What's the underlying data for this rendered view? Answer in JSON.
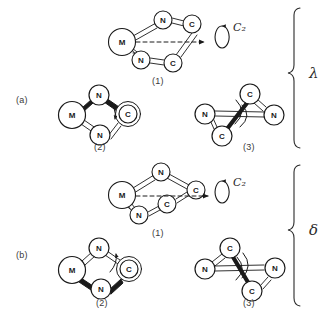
{
  "figure": {
    "type": "chemical-structure-diagram",
    "background_color": "#ffffff",
    "line_color": "#1a1a1a",
    "atom_fill_color": "#ffffff"
  },
  "panels": [
    {
      "key": "a",
      "label": "(a)",
      "chirality_label": "λ",
      "structures": [
        {
          "key": "a1",
          "label": "(1)",
          "view": "perspective-ring",
          "atoms": [
            {
              "id": "M",
              "symbol": "M",
              "x": 122,
              "y": 42,
              "r": 13,
              "size": "large"
            },
            {
              "id": "N1",
              "symbol": "N",
              "x": 163,
              "y": 20,
              "r": 9,
              "size": "small"
            },
            {
              "id": "C1",
              "symbol": "C",
              "x": 192,
              "y": 24,
              "r": 9,
              "size": "small"
            },
            {
              "id": "C2",
              "symbol": "C",
              "x": 173,
              "y": 63,
              "r": 9,
              "size": "small"
            },
            {
              "id": "N2",
              "symbol": "N",
              "x": 141,
              "y": 60,
              "r": 9,
              "size": "small"
            }
          ],
          "bonds": [
            {
              "from": "M",
              "to": "N1",
              "style": "double-line"
            },
            {
              "from": "N1",
              "to": "C1",
              "style": "double-line"
            },
            {
              "from": "C1",
              "to": "C2",
              "style": "double-line"
            },
            {
              "from": "C2",
              "to": "N2",
              "style": "double-line"
            },
            {
              "from": "N2",
              "to": "M",
              "style": "double-line"
            }
          ],
          "axis": {
            "type": "dashed-arrow",
            "x1": 132,
            "y1": 42,
            "x2": 205,
            "y2": 42,
            "label": "C₂"
          }
        },
        {
          "key": "a2",
          "label": "(2)",
          "view": "newman-like",
          "atoms": [
            {
              "id": "M",
              "symbol": "M",
              "x": 72,
              "y": 115,
              "r": 13,
              "size": "large"
            },
            {
              "id": "N1",
              "symbol": "N",
              "x": 99,
              "y": 95,
              "r": 10,
              "size": "small"
            },
            {
              "id": "C",
              "symbol": "C",
              "x": 128,
              "y": 114,
              "r": 10,
              "size": "ringed"
            },
            {
              "id": "N2",
              "symbol": "N",
              "x": 100,
              "y": 135,
              "r": 10,
              "size": "small"
            }
          ],
          "bonds": [
            {
              "from": "M",
              "to": "N1",
              "style": "bold-wedge"
            },
            {
              "from": "N1",
              "to": "C",
              "style": "bold-wedge"
            },
            {
              "from": "M",
              "to": "N2",
              "style": "double-line"
            },
            {
              "from": "N2",
              "to": "C",
              "style": "double-line"
            }
          ],
          "curved_arrow": true
        },
        {
          "key": "a3",
          "label": "(3)",
          "view": "newman-projection",
          "atoms": [
            {
              "id": "Ctop",
              "symbol": "C",
              "x": 250,
              "y": 94,
              "r": 10,
              "size": "small"
            },
            {
              "id": "Nleft",
              "symbol": "N",
              "x": 205,
              "y": 114,
              "r": 10,
              "size": "small"
            },
            {
              "id": "Nright",
              "symbol": "N",
              "x": 274,
              "y": 115,
              "r": 10,
              "size": "small"
            },
            {
              "id": "Cbot",
              "symbol": "C",
              "x": 222,
              "y": 136,
              "r": 10,
              "size": "small"
            }
          ],
          "bonds": [
            {
              "from": "Ctop",
              "to": "Cbot",
              "style": "bold-line"
            },
            {
              "from": "Nleft",
              "to": "Cbot",
              "style": "double-line"
            },
            {
              "from": "Nleft",
              "to": "Nright",
              "style": "double-line"
            },
            {
              "from": "Ctop",
              "to": "Nright",
              "style": "double-line"
            }
          ],
          "curved_arrow": true
        }
      ]
    },
    {
      "key": "b",
      "label": "(b)",
      "chirality_label": "δ",
      "structures": [
        {
          "key": "b1",
          "label": "(1)",
          "view": "perspective-ring",
          "atoms": [
            {
              "id": "M",
              "symbol": "M",
              "x": 122,
              "y": 195,
              "r": 13,
              "size": "large"
            },
            {
              "id": "N1",
              "symbol": "N",
              "x": 161,
              "y": 172,
              "r": 9,
              "size": "small"
            },
            {
              "id": "C1",
              "symbol": "C",
              "x": 196,
              "y": 190,
              "r": 9,
              "size": "small"
            },
            {
              "id": "C2",
              "symbol": "C",
              "x": 167,
              "y": 204,
              "r": 9,
              "size": "small"
            },
            {
              "id": "N2",
              "symbol": "N",
              "x": 139,
              "y": 215,
              "r": 9,
              "size": "small"
            }
          ],
          "bonds": [
            {
              "from": "M",
              "to": "N1",
              "style": "double-line"
            },
            {
              "from": "N1",
              "to": "C1",
              "style": "double-line"
            },
            {
              "from": "C1",
              "to": "C2",
              "style": "double-line"
            },
            {
              "from": "C2",
              "to": "N2",
              "style": "double-line"
            },
            {
              "from": "N2",
              "to": "M",
              "style": "double-line"
            }
          ],
          "axis": {
            "type": "dashed-arrow",
            "x1": 132,
            "y1": 196,
            "x2": 208,
            "y2": 196,
            "label": "C₂"
          }
        },
        {
          "key": "b2",
          "label": "(2)",
          "view": "newman-like",
          "atoms": [
            {
              "id": "M",
              "symbol": "M",
              "x": 72,
              "y": 270,
              "r": 13,
              "size": "large"
            },
            {
              "id": "N1",
              "symbol": "N",
              "x": 99,
              "y": 248,
              "r": 10,
              "size": "small"
            },
            {
              "id": "C",
              "symbol": "C",
              "x": 129,
              "y": 269,
              "r": 10,
              "size": "ringed"
            },
            {
              "id": "N2",
              "symbol": "N",
              "x": 101,
              "y": 289,
              "r": 10,
              "size": "small"
            }
          ],
          "bonds": [
            {
              "from": "M",
              "to": "N1",
              "style": "double-line"
            },
            {
              "from": "N1",
              "to": "C",
              "style": "double-line"
            },
            {
              "from": "M",
              "to": "N2",
              "style": "bold-wedge"
            },
            {
              "from": "N2",
              "to": "C",
              "style": "bold-wedge"
            }
          ],
          "curved_arrow": true
        },
        {
          "key": "b3",
          "label": "(3)",
          "view": "newman-projection",
          "atoms": [
            {
              "id": "Ctop",
              "symbol": "C",
              "x": 230,
              "y": 248,
              "r": 10,
              "size": "small"
            },
            {
              "id": "Nleft",
              "symbol": "N",
              "x": 205,
              "y": 269,
              "r": 10,
              "size": "small"
            },
            {
              "id": "Nright",
              "symbol": "N",
              "x": 275,
              "y": 268,
              "r": 10,
              "size": "small"
            },
            {
              "id": "Cbot",
              "symbol": "C",
              "x": 252,
              "y": 291,
              "r": 10,
              "size": "small"
            }
          ],
          "bonds": [
            {
              "from": "Ctop",
              "to": "Cbot",
              "style": "bold-line"
            },
            {
              "from": "Ctop",
              "to": "Nleft",
              "style": "double-line"
            },
            {
              "from": "Nleft",
              "to": "Nright",
              "style": "double-line"
            },
            {
              "from": "Cbot",
              "to": "Nright",
              "style": "double-line"
            }
          ],
          "curved_arrow": true
        }
      ]
    }
  ],
  "labels": {
    "panel_a": "(a)",
    "panel_b": "(b)",
    "a1": "(1)",
    "a2": "(2)",
    "a3": "(3)",
    "b1": "(1)",
    "b2": "(2)",
    "b3": "(3)",
    "axis_symbol_top": "C₂",
    "axis_symbol_bottom": "C₂",
    "lambda": "λ",
    "delta": "δ",
    "atom_M": "M",
    "atom_N": "N",
    "atom_C": "C"
  }
}
